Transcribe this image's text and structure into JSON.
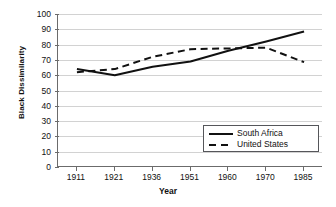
{
  "chart_data": {
    "type": "line",
    "title": "",
    "xlabel": "Year",
    "ylabel": "Black Dissimilarity",
    "categories": [
      "1911",
      "1921",
      "1936",
      "1951",
      "1960",
      "1970",
      "1985"
    ],
    "x_tick_labels": [
      "1911",
      "1921",
      "1936",
      "1951",
      "1960",
      "1970",
      "1985"
    ],
    "y_tick_labels": [
      "100",
      "90",
      "80",
      "70",
      "60",
      "50",
      "40",
      "30",
      "20",
      "10",
      "0"
    ],
    "y_ticks": [
      100,
      90,
      80,
      70,
      60,
      50,
      40,
      30,
      20,
      10,
      0
    ],
    "ylim": [
      0,
      100
    ],
    "grid": "horizontal",
    "legend_position": "inside-lower-right",
    "series": [
      {
        "name": "South Africa",
        "style": "solid",
        "color": "#111111",
        "values": [
          64,
          60,
          65.5,
          69,
          76,
          82,
          88.5
        ]
      },
      {
        "name": "United States",
        "style": "dashed",
        "color": "#111111",
        "values": [
          62,
          64,
          72,
          77,
          77.5,
          78,
          68.5
        ]
      }
    ]
  },
  "legend": {
    "items": [
      {
        "label": "South Africa",
        "style": "solid"
      },
      {
        "label": "United States",
        "style": "dashed"
      }
    ]
  },
  "colors": {
    "line": "#111111",
    "grid": "#d2d2d2",
    "axis": "#6b6b6b",
    "background": "#ffffff",
    "text": "#111111"
  }
}
